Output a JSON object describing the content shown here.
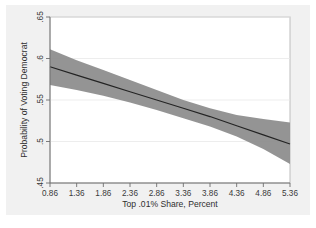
{
  "chart_data": {
    "type": "line",
    "title": "",
    "subtitle": "",
    "xlabel": "Top .01% Share, Percent",
    "ylabel": "Probability of Voting Democrat",
    "xlim": [
      0.86,
      5.36
    ],
    "ylim": [
      0.45,
      0.65
    ],
    "grid": true,
    "legend": null,
    "legend_position": "none",
    "xticks": [
      0.86,
      1.36,
      1.86,
      2.36,
      2.86,
      3.36,
      3.86,
      4.36,
      4.86,
      5.36
    ],
    "xtick_labels": [
      "0.86",
      "1.36",
      "1.86",
      "2.36",
      "2.86",
      "3.36",
      "3.86",
      "4.36",
      "4.86",
      "5.36"
    ],
    "yticks": [
      0.45,
      0.5,
      0.55,
      0.6,
      0.65
    ],
    "ytick_labels": [
      ".45",
      ".5",
      ".55",
      ".6",
      ".65"
    ],
    "series": [
      {
        "name": "Predicted probability",
        "type": "line",
        "color": "#232323",
        "x": [
          0.86,
          1.36,
          1.86,
          2.36,
          2.86,
          3.36,
          3.86,
          4.36,
          4.86,
          5.36
        ],
        "values": [
          0.59,
          0.58,
          0.57,
          0.56,
          0.55,
          0.54,
          0.53,
          0.519,
          0.508,
          0.497
        ]
      },
      {
        "name": "95% confidence interval",
        "type": "band",
        "color": "#8e8e8e",
        "x": [
          0.86,
          1.36,
          1.86,
          2.36,
          2.86,
          3.36,
          3.86,
          4.36,
          4.86,
          5.36
        ],
        "upper": [
          0.611,
          0.598,
          0.586,
          0.574,
          0.562,
          0.55,
          0.54,
          0.532,
          0.527,
          0.523
        ],
        "lower": [
          0.568,
          0.562,
          0.555,
          0.547,
          0.538,
          0.528,
          0.518,
          0.506,
          0.491,
          0.473
        ]
      }
    ]
  },
  "axes": {
    "x_title": "Top .01% Share, Percent",
    "y_title": "Probability of Voting Democrat"
  }
}
